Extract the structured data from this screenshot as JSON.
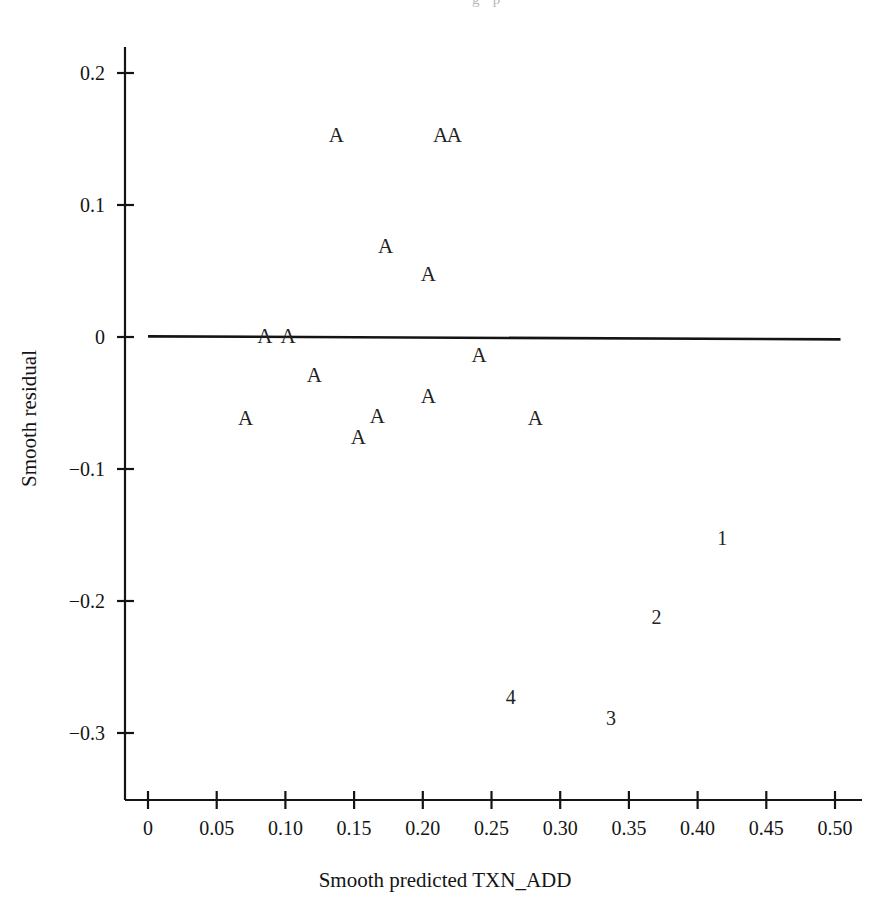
{
  "page": {
    "top_caption": "· · ·   ·  · · · · · · g · p ·"
  },
  "chart_data": {
    "type": "scatter",
    "title": "",
    "xlabel": "Smooth predicted TXN_ADD",
    "ylabel": "Smooth residual",
    "xlim": [
      0.0,
      0.51
    ],
    "ylim": [
      -0.32,
      0.225
    ],
    "xticks": [
      0,
      0.05,
      0.1,
      0.15,
      0.2,
      0.25,
      0.3,
      0.35,
      0.4,
      0.45,
      0.5
    ],
    "xticklabels": [
      "0",
      "0.05",
      "0.10",
      "0.15",
      "0.20",
      "0.25",
      "0.30",
      "0.35",
      "0.40",
      "0.45",
      "0.50"
    ],
    "yticks": [
      0.2,
      0.1,
      0,
      -0.1,
      -0.2,
      -0.3
    ],
    "yticklabels": [
      "0.2",
      "0.1",
      "0",
      "−0.1",
      "−0.2",
      "−0.3"
    ],
    "grid": false,
    "legend": null,
    "marker_style": "text-label",
    "reference_line": {
      "name": "zero-reference-line",
      "x_start": 0.0,
      "y_start": 0.0005,
      "x_end": 0.504,
      "y_end": -0.0018,
      "color": "#141414"
    },
    "points": [
      {
        "label": "A",
        "x": 0.137,
        "y": 0.153
      },
      {
        "label": "A",
        "x": 0.213,
        "y": 0.153
      },
      {
        "label": "A",
        "x": 0.223,
        "y": 0.153
      },
      {
        "label": "A",
        "x": 0.173,
        "y": 0.069
      },
      {
        "label": "A",
        "x": 0.204,
        "y": 0.048
      },
      {
        "label": "A",
        "x": 0.085,
        "y": 0.0008
      },
      {
        "label": "A",
        "x": 0.102,
        "y": 0.0008
      },
      {
        "label": "A",
        "x": 0.121,
        "y": -0.029
      },
      {
        "label": "A",
        "x": 0.241,
        "y": -0.014
      },
      {
        "label": "A",
        "x": 0.071,
        "y": -0.061
      },
      {
        "label": "A",
        "x": 0.167,
        "y": -0.06
      },
      {
        "label": "A",
        "x": 0.153,
        "y": -0.076
      },
      {
        "label": "A",
        "x": 0.204,
        "y": -0.045
      },
      {
        "label": "A",
        "x": 0.282,
        "y": -0.061
      },
      {
        "label": "1",
        "x": 0.418,
        "y": -0.152
      },
      {
        "label": "2",
        "x": 0.37,
        "y": -0.212
      },
      {
        "label": "4",
        "x": 0.264,
        "y": -0.273
      },
      {
        "label": "3",
        "x": 0.337,
        "y": -0.289
      }
    ]
  }
}
